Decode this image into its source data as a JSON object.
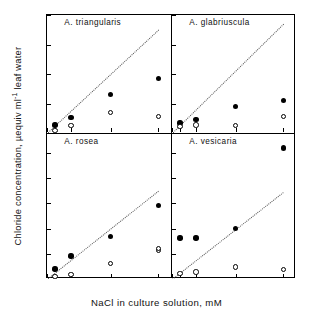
{
  "chart_data": {
    "type": "scatter",
    "title": "",
    "xlabel": "NaCl in culture solution, mM",
    "ylabel": "Chloride concentration, µequiv ml⁻¹ leaf water",
    "ylabel_parts": {
      "pre": "Chloride concentration, µequiv ml",
      "sup": "-1",
      "post": " leaf water"
    },
    "x_categories": [
      "0",
      "50",
      "150",
      "400",
      "700"
    ],
    "x_tick_values": [
      0,
      50,
      150,
      400,
      700
    ],
    "xlim": [
      0,
      780
    ],
    "grid": false,
    "legend_position": "none",
    "series_names": [
      "filled-circle",
      "open-circle"
    ],
    "reference_line": {
      "style": "dotted",
      "description": "1:1 external NaCl reference line"
    },
    "panels": [
      {
        "id": "a-triangularis",
        "title": "A. triangularis",
        "position": "top-left",
        "ylim": [
          0,
          800
        ],
        "y_tick_values": [
          0,
          200,
          400,
          600,
          800
        ],
        "y_tick_labels": [
          "0",
          "200",
          "400",
          "600",
          "800"
        ],
        "refline": {
          "x0": 0,
          "y0": 0,
          "x1": 700,
          "y1": 700
        },
        "series": [
          {
            "name": "filled-circle",
            "marker": "filled",
            "x": [
              50,
              150,
              400,
              700
            ],
            "values": [
              55,
              105,
              262,
              368
            ]
          },
          {
            "name": "open-circle",
            "marker": "open",
            "x": [
              50,
              150,
              400,
              700
            ],
            "values": [
              18,
              50,
              140,
              110
            ]
          }
        ]
      },
      {
        "id": "a-glabriuscula",
        "title": "A. glabriuscula",
        "position": "top-right",
        "ylim": [
          0,
          800
        ],
        "y_tick_values": [
          0,
          200,
          400,
          600,
          800
        ],
        "y_tick_labels": [
          "",
          "",
          "",
          "",
          ""
        ],
        "refline": {
          "x0": 0,
          "y0": 0,
          "x1": 700,
          "y1": 740
        },
        "series": [
          {
            "name": "filled-circle",
            "marker": "filled",
            "x": [
              50,
              150,
              400,
              700
            ],
            "values": [
              68,
              90,
              180,
              220
            ]
          },
          {
            "name": "open-circle",
            "marker": "open",
            "x": [
              50,
              150,
              400,
              700
            ],
            "values": [
              45,
              55,
              52,
              112
            ]
          }
        ]
      },
      {
        "id": "a-rosea",
        "title": "A. rosea",
        "position": "bottom-left",
        "ylim": [
          0,
          1150
        ],
        "y_tick_values": [
          0,
          200,
          400,
          600,
          800,
          1000
        ],
        "y_tick_labels": [
          "0",
          "200",
          "400",
          "600",
          "800",
          "1000"
        ],
        "refline": {
          "x0": 0,
          "y0": 0,
          "x1": 700,
          "y1": 700
        },
        "series": [
          {
            "name": "filled-circle",
            "marker": "filled",
            "x": [
              50,
              150,
              400,
              700
            ],
            "values": [
              80,
              182,
              338,
              585
            ]
          },
          {
            "name": "open-circle",
            "marker": "open",
            "x": [
              50,
              150,
              400,
              700,
              700
            ],
            "values": [
              20,
              35,
              122,
              225,
              240
            ]
          }
        ]
      },
      {
        "id": "a-vesicaria",
        "title": "A. vesicaria",
        "position": "bottom-right",
        "ylim": [
          0,
          1150
        ],
        "y_tick_values": [
          0,
          200,
          400,
          600,
          800,
          1000
        ],
        "y_tick_labels": [
          "",
          "",
          "",
          "",
          "",
          ""
        ],
        "refline": {
          "x0": 0,
          "y0": 0,
          "x1": 700,
          "y1": 690
        },
        "series": [
          {
            "name": "filled-circle",
            "marker": "filled",
            "x": [
              50,
              150,
              400,
              700
            ],
            "values": [
              325,
              325,
              400,
              1040
            ]
          },
          {
            "name": "open-circle",
            "marker": "open",
            "x": [
              50,
              150,
              400,
              700
            ],
            "values": [
              45,
              55,
              95,
              75
            ]
          }
        ]
      }
    ]
  }
}
